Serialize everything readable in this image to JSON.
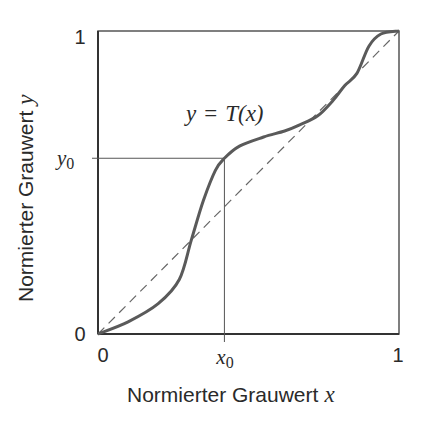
{
  "chart_data": {
    "type": "line",
    "title": "",
    "xlabel": "Normierter Grauwert x",
    "ylabel": "Normierter Grauwert y",
    "xlabel_text": "Normierter Grauwert",
    "xlabel_var": "x",
    "ylabel_text": "Normierter Grauwert",
    "ylabel_var": "y",
    "xlim": [
      0,
      1
    ],
    "ylim": [
      0,
      1
    ],
    "grid": false,
    "legend": "none",
    "x_ticks": [
      "0",
      "x0",
      "1"
    ],
    "y_ticks": [
      "0",
      "y0",
      "1"
    ],
    "tick_labels": {
      "x_zero": "0",
      "x_one": "1",
      "y_zero": "0",
      "y_one": "1",
      "x0_base": "x",
      "x0_sub": "0",
      "y0_base": "y",
      "y0_sub": "0"
    },
    "annotation": {
      "lhs": "y",
      "eq": "=",
      "rhs_func": "T",
      "rhs_arg": "(x)",
      "full": "y = T(x)"
    },
    "marked_point": {
      "x0": 0.42,
      "y0": 0.58
    },
    "series": [
      {
        "name": "T(x)",
        "style": "solid",
        "x": [
          0,
          0.1,
          0.2,
          0.27,
          0.31,
          0.35,
          0.39,
          0.42,
          0.47,
          0.55,
          0.62,
          0.67,
          0.73,
          0.78,
          0.82,
          0.86,
          0.9,
          0.94,
          1.0
        ],
        "y": [
          0,
          0.04,
          0.1,
          0.18,
          0.31,
          0.44,
          0.54,
          0.58,
          0.62,
          0.65,
          0.67,
          0.69,
          0.72,
          0.77,
          0.82,
          0.86,
          0.95,
          0.99,
          1.0
        ]
      },
      {
        "name": "identity y = x",
        "style": "dashed",
        "x": [
          0,
          1
        ],
        "y": [
          0,
          1
        ]
      }
    ]
  }
}
